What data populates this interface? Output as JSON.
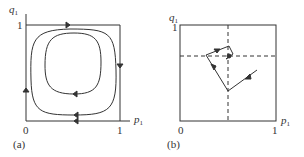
{
  "panels": [
    {
      "id": "a",
      "caption": "(a)",
      "x_axis": {
        "label": "p",
        "sub": "1",
        "ticks": [
          "0",
          "1"
        ]
      },
      "y_axis": {
        "label": "q",
        "sub": "1",
        "ticks": [
          "1"
        ]
      },
      "description": "Nested closed orbits inside unit square; boundary traversed clockwise"
    },
    {
      "id": "b",
      "caption": "(b)",
      "x_axis": {
        "label": "p",
        "sub": "1",
        "ticks": [
          "0",
          "1"
        ]
      },
      "y_axis": {
        "label": "q",
        "sub": "1",
        "ticks": [
          "1"
        ]
      },
      "description": "Trajectory spiraling into interior equilibrium at dashed-line intersection"
    }
  ],
  "colors": {
    "line": "#333333",
    "background": "#ffffff"
  }
}
